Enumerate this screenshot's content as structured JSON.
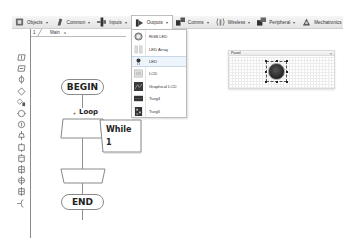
{
  "toolbar": {
    "items": [
      {
        "label": "Objects",
        "icon": "objects-icon"
      },
      {
        "label": "Common",
        "icon": "common-icon"
      },
      {
        "label": "Inputs",
        "icon": "inputs-icon"
      },
      {
        "label": "Outputs",
        "icon": "outputs-icon",
        "active": true
      },
      {
        "label": "Comms",
        "icon": "comms-icon"
      },
      {
        "label": "Wireless",
        "icon": "wireless-icon"
      },
      {
        "label": "Peripheral",
        "icon": "peripheral-icon"
      },
      {
        "label": "Mechatronics",
        "icon": "mechatronics-icon"
      }
    ],
    "caret": "▾"
  },
  "tabs": {
    "number": "1",
    "main_label": "Main",
    "close": "x"
  },
  "outputs_menu": {
    "items": [
      {
        "label": "RGB LED",
        "icon": "rgb-led-icon"
      },
      {
        "label": "LED Array",
        "icon": "led-array-icon"
      },
      {
        "label": "LED",
        "icon": "led-icon",
        "highlighted": true
      },
      {
        "label": "LCD",
        "icon": "lcd-icon"
      },
      {
        "label": "Graphical LCD",
        "icon": "graphical-lcd-icon"
      },
      {
        "label": "Tseg4",
        "icon": "tseg4-icon"
      },
      {
        "label": "Tseg5",
        "icon": "tseg5-icon"
      }
    ]
  },
  "flowchart": {
    "begin": "BEGIN",
    "loop_label": "Loop",
    "loop_plus": "+",
    "while_line1": "While",
    "while_line2": "1",
    "end": "END"
  },
  "panel": {
    "title": "Panel",
    "close": "×",
    "component": "LED"
  },
  "palette": {
    "icons": [
      "input-icon",
      "output-icon",
      "delay-icon",
      "decision-icon",
      "switch-icon",
      "macro-icon",
      "component-macro-icon",
      "loop-icon",
      "calculation-icon",
      "connection-point-icon",
      "code-icon",
      "interrupt-icon",
      "c-code-icon",
      "comment-icon"
    ]
  },
  "colors": {
    "toolbar_bg": "#ececec",
    "menu_highlight": "#eef4fb",
    "flow_line": "#8a8a8a",
    "led": "#2a2a2a"
  }
}
